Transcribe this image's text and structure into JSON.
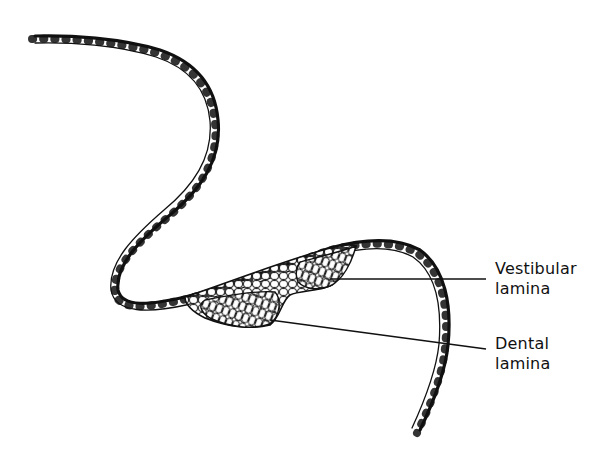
{
  "diagram": {
    "colors": {
      "ink": "#111111",
      "background": "#ffffff"
    },
    "labels": [
      {
        "id": "vestibular",
        "lines": [
          "Vestibular",
          "lamina"
        ]
      },
      {
        "id": "dental",
        "lines": [
          "Dental",
          "lamina"
        ]
      }
    ]
  }
}
